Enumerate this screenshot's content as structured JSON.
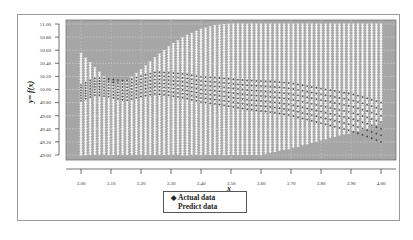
{
  "chart_data": {
    "type": "scatter",
    "title": "",
    "xlabel": "x",
    "ylabel": "y= f(x)",
    "xlim": [
      3.0,
      4.0
    ],
    "ylim": [
      49.0,
      51.0
    ],
    "x_ticks": [
      "3.00",
      "3.10",
      "3.20",
      "3.30",
      "3.40",
      "3.50",
      "3.60",
      "3.70",
      "3.80",
      "3.90",
      "4.00"
    ],
    "y_ticks": [
      "51.00",
      "50.80",
      "50.60",
      "50.40",
      "50.20",
      "50.00",
      "49.80",
      "49.60",
      "49.40",
      "49.20",
      "49.00"
    ],
    "grid": true,
    "plot_background": "#a6a6a6",
    "legend_position": "bottom-center",
    "series": [
      {
        "name": "Actual data",
        "marker": "diamond",
        "color": "#1a1a1a",
        "x": [
          3.0,
          3.05,
          3.1,
          3.15,
          3.2,
          3.25,
          3.3,
          3.35,
          3.4,
          3.45,
          3.5,
          3.55,
          3.6,
          3.65,
          3.7,
          3.75,
          3.8,
          3.85,
          3.9,
          3.95,
          4.0
        ],
        "values": [
          49.95,
          50.05,
          50.02,
          49.98,
          50.05,
          50.1,
          50.08,
          50.05,
          50.0,
          49.98,
          49.95,
          49.92,
          49.9,
          49.88,
          49.85,
          49.8,
          49.75,
          49.7,
          49.65,
          49.58,
          49.5
        ]
      },
      {
        "name": "Predict data",
        "marker": "white-cross",
        "color": "#ffffff",
        "description": "dense vertical columns of predicted points filling band between lower and upper envelope",
        "x": [
          3.0,
          3.05,
          3.1,
          3.15,
          3.2,
          3.25,
          3.3,
          3.35,
          3.4,
          3.45,
          3.5,
          3.55,
          3.6,
          3.65,
          3.7,
          3.75,
          3.8,
          3.85,
          3.9,
          3.95,
          4.0
        ],
        "upper": [
          50.55,
          50.32,
          50.08,
          50.12,
          50.3,
          50.5,
          50.68,
          50.82,
          50.92,
          50.98,
          51.0,
          51.0,
          51.0,
          51.0,
          51.0,
          51.0,
          51.0,
          51.0,
          51.0,
          51.0,
          51.0
        ],
        "lower": [
          49.0,
          49.0,
          49.0,
          49.0,
          49.0,
          49.0,
          49.0,
          49.0,
          49.0,
          49.0,
          49.0,
          49.0,
          49.0,
          49.05,
          49.1,
          49.16,
          49.22,
          49.28,
          49.34,
          49.4,
          49.48
        ]
      }
    ]
  },
  "legend": {
    "items": [
      {
        "label": "Actual data",
        "marker": "◆"
      },
      {
        "label": "Predict data",
        "marker": ""
      }
    ]
  },
  "axes": {
    "xlabel": "x",
    "ylabel": "y= f(x)"
  }
}
